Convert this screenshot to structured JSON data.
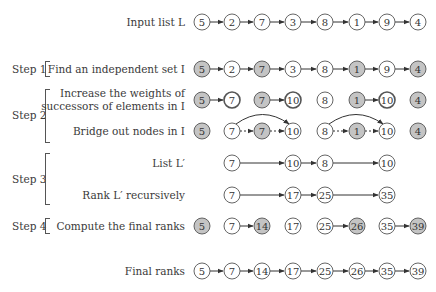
{
  "colors": {
    "shaded_fill": "#c4c4c4",
    "plain_fill": "#ffffff",
    "stroke": "#555555",
    "arrow": "#333333"
  },
  "labels": {
    "input": "Input list L",
    "find_independent": "Find an independent set I",
    "increase_line1": "Increase the weights of",
    "increase_line2": "successors of elements in I",
    "bridge": "Bridge out nodes in I",
    "list_lprime": "List L′",
    "rank_lprime": "Rank L′ recursively",
    "compute_final": "Compute the final ranks",
    "final": "Final ranks"
  },
  "steps": {
    "step1": "Step 1",
    "step2": "Step 2",
    "step3": "Step 3",
    "step4": "Step 4"
  },
  "rows": {
    "input": {
      "nodes": [
        {
          "v": "5",
          "shaded": false
        },
        {
          "v": "2",
          "shaded": false
        },
        {
          "v": "7",
          "shaded": false
        },
        {
          "v": "3",
          "shaded": false
        },
        {
          "v": "8",
          "shaded": false
        },
        {
          "v": "1",
          "shaded": false
        },
        {
          "v": "9",
          "shaded": false
        },
        {
          "v": "4",
          "shaded": false
        }
      ],
      "arrows": [
        [
          0,
          1
        ],
        [
          1,
          2
        ],
        [
          2,
          3
        ],
        [
          3,
          4
        ],
        [
          4,
          5
        ],
        [
          5,
          6
        ],
        [
          6,
          7
        ]
      ]
    },
    "step1": {
      "nodes": [
        {
          "v": "5",
          "shaded": true
        },
        {
          "v": "2",
          "shaded": false
        },
        {
          "v": "7",
          "shaded": true
        },
        {
          "v": "3",
          "shaded": false
        },
        {
          "v": "8",
          "shaded": false
        },
        {
          "v": "1",
          "shaded": true
        },
        {
          "v": "9",
          "shaded": false
        },
        {
          "v": "4",
          "shaded": true
        }
      ],
      "arrows": [
        [
          0,
          1
        ],
        [
          1,
          2
        ],
        [
          2,
          3
        ],
        [
          3,
          4
        ],
        [
          4,
          5
        ],
        [
          5,
          6
        ],
        [
          6,
          7
        ]
      ]
    },
    "step2a": {
      "nodes": [
        {
          "v": "5",
          "shaded": true
        },
        {
          "v": "7",
          "shaded": false,
          "bold": true
        },
        {
          "v": "7",
          "shaded": true
        },
        {
          "v": "10",
          "shaded": false,
          "bold": true
        },
        {
          "v": "8",
          "shaded": false
        },
        {
          "v": "1",
          "shaded": true
        },
        {
          "v": "10",
          "shaded": false,
          "bold": true
        },
        {
          "v": "4",
          "shaded": true
        }
      ],
      "arrows": [
        [
          0,
          1
        ],
        [
          2,
          3
        ],
        [
          5,
          6
        ]
      ]
    },
    "step2b": {
      "nodes": [
        {
          "v": "5",
          "shaded": true
        },
        {
          "v": "7",
          "shaded": false
        },
        {
          "v": "7",
          "shaded": true
        },
        {
          "v": "10",
          "shaded": false
        },
        {
          "v": "8",
          "shaded": false
        },
        {
          "v": "1",
          "shaded": true
        },
        {
          "v": "10",
          "shaded": false
        },
        {
          "v": "4",
          "shaded": true
        }
      ],
      "dashed_arrows": [
        [
          1,
          2
        ],
        [
          2,
          3
        ],
        [
          4,
          5
        ],
        [
          5,
          6
        ]
      ],
      "curved_arrows": [
        [
          1,
          3
        ],
        [
          4,
          6
        ]
      ]
    },
    "list_lprime": {
      "nodes": [
        {
          "pos": 1,
          "v": "7"
        },
        {
          "pos": 3,
          "v": "10"
        },
        {
          "pos": 4,
          "v": "8"
        },
        {
          "pos": 6,
          "v": "10"
        }
      ],
      "arrows": [
        [
          1,
          3
        ],
        [
          3,
          4
        ],
        [
          4,
          6
        ]
      ]
    },
    "rank_lprime": {
      "nodes": [
        {
          "pos": 1,
          "v": "7"
        },
        {
          "pos": 3,
          "v": "17"
        },
        {
          "pos": 4,
          "v": "25"
        },
        {
          "pos": 6,
          "v": "35"
        }
      ],
      "arrows": [
        [
          1,
          3
        ],
        [
          3,
          4
        ],
        [
          4,
          6
        ]
      ]
    },
    "step4": {
      "nodes": [
        {
          "v": "5",
          "shaded": true
        },
        {
          "v": "7",
          "shaded": false
        },
        {
          "v": "14",
          "shaded": true
        },
        {
          "v": "17",
          "shaded": false
        },
        {
          "v": "25",
          "shaded": false
        },
        {
          "v": "26",
          "shaded": true
        },
        {
          "v": "35",
          "shaded": false
        },
        {
          "v": "39",
          "shaded": true
        }
      ],
      "arrows": [
        [
          1,
          2
        ],
        [
          4,
          5
        ],
        [
          6,
          7
        ]
      ]
    },
    "final": {
      "nodes": [
        {
          "v": "5",
          "shaded": false
        },
        {
          "v": "7",
          "shaded": false
        },
        {
          "v": "14",
          "shaded": false
        },
        {
          "v": "17",
          "shaded": false
        },
        {
          "v": "25",
          "shaded": false
        },
        {
          "v": "26",
          "shaded": false
        },
        {
          "v": "35",
          "shaded": false
        },
        {
          "v": "39",
          "shaded": false
        }
      ],
      "arrows": [
        [
          0,
          1
        ],
        [
          1,
          2
        ],
        [
          2,
          3
        ],
        [
          3,
          4
        ],
        [
          4,
          5
        ],
        [
          5,
          6
        ],
        [
          6,
          7
        ]
      ]
    }
  }
}
